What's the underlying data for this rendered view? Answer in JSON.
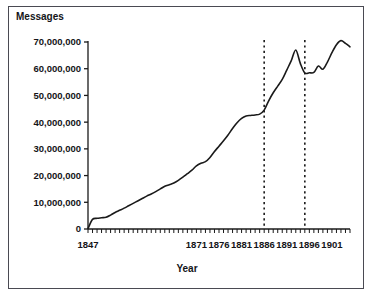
{
  "figure": {
    "frame_color": "#4a4a52",
    "background": "#ffffff"
  },
  "axis_titles": {
    "y": "Messages",
    "x": "Year"
  },
  "chart_data": {
    "type": "line",
    "title": "",
    "subtitle": "",
    "xlabel": "Year",
    "ylabel": "Messages",
    "xlim": [
      1847,
      1905
    ],
    "ylim": [
      0,
      70000000
    ],
    "grid": false,
    "legend": false,
    "legend_position": "none",
    "line_color": "#1a1a1a",
    "x_tick_labels": [
      "1847",
      "1871",
      "1876",
      "1881",
      "1886",
      "1891",
      "1896",
      "1901"
    ],
    "x_tick_values": [
      1847,
      1871,
      1876,
      1881,
      1886,
      1891,
      1896,
      1901
    ],
    "x_minor_ticks_every_year": true,
    "y_tick_labels": [
      "0",
      "10,000,000",
      "20,000,000",
      "30,000,000",
      "40,000,000",
      "50,000,000",
      "60,000,000",
      "70,000,000"
    ],
    "y_tick_values": [
      0,
      10000000,
      20000000,
      30000000,
      40000000,
      50000000,
      60000000,
      70000000
    ],
    "annotations": [
      {
        "type": "vertical-dashed-line",
        "x": 1886,
        "label": ""
      },
      {
        "type": "vertical-dashed-line",
        "x": 1895,
        "label": ""
      }
    ],
    "series": [
      {
        "name": "Messages",
        "x": [
          1847,
          1848,
          1849,
          1850,
          1851,
          1852,
          1853,
          1854,
          1855,
          1856,
          1857,
          1858,
          1859,
          1860,
          1861,
          1862,
          1863,
          1864,
          1865,
          1866,
          1867,
          1868,
          1869,
          1870,
          1871,
          1872,
          1873,
          1874,
          1875,
          1876,
          1877,
          1878,
          1879,
          1880,
          1881,
          1882,
          1883,
          1884,
          1885,
          1886,
          1887,
          1888,
          1889,
          1890,
          1891,
          1892,
          1893,
          1894,
          1895,
          1896,
          1897,
          1898,
          1899,
          1900,
          1901,
          1902,
          1903,
          1904,
          1905
        ],
        "values": [
          200000,
          3600000,
          4000000,
          4200000,
          4400000,
          5200000,
          6200000,
          7000000,
          7800000,
          8700000,
          9600000,
          10500000,
          11400000,
          12300000,
          13100000,
          14000000,
          15000000,
          16000000,
          16600000,
          17200000,
          18200000,
          19400000,
          20700000,
          22000000,
          23600000,
          24600000,
          25200000,
          26800000,
          29000000,
          31000000,
          33000000,
          35200000,
          37600000,
          39800000,
          41400000,
          42300000,
          42500000,
          42700000,
          43000000,
          44500000,
          48000000,
          51000000,
          53500000,
          56000000,
          59500000,
          63000000,
          67000000,
          62000000,
          58400000,
          58500000,
          58600000,
          61000000,
          59800000,
          62500000,
          66000000,
          69000000,
          70500000,
          69500000,
          68200000
        ]
      }
    ]
  }
}
